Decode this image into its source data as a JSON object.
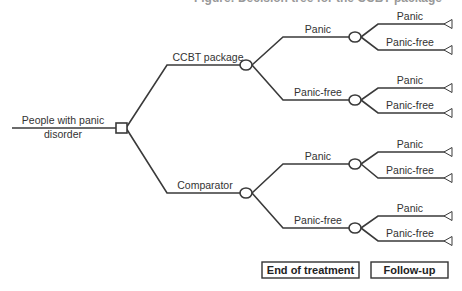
{
  "title_clipped": "Figure: Decision tree for the CCBT package",
  "root": {
    "label_line1": "People with panic",
    "label_line2": "disorder",
    "node_type": "decision-square"
  },
  "arms": [
    {
      "label": "CCBT package",
      "node_type": "chance-circle",
      "branches": [
        {
          "label": "Panic",
          "outcomes": [
            "Panic",
            "Panic-free"
          ]
        },
        {
          "label": "Panic-free",
          "outcomes": [
            "Panic",
            "Panic-free"
          ]
        }
      ]
    },
    {
      "label": "Comparator",
      "node_type": "chance-circle",
      "branches": [
        {
          "label": "Panic",
          "outcomes": [
            "Panic",
            "Panic-free"
          ]
        },
        {
          "label": "Panic-free",
          "outcomes": [
            "Panic",
            "Panic-free"
          ]
        }
      ]
    }
  ],
  "terminal_icon": "triangle-terminal-icon",
  "stages": {
    "end_of_treatment": "End of treatment",
    "follow_up": "Follow-up"
  },
  "colors": {
    "line": "#3a3a3a",
    "text": "#333333",
    "background": "#ffffff"
  }
}
